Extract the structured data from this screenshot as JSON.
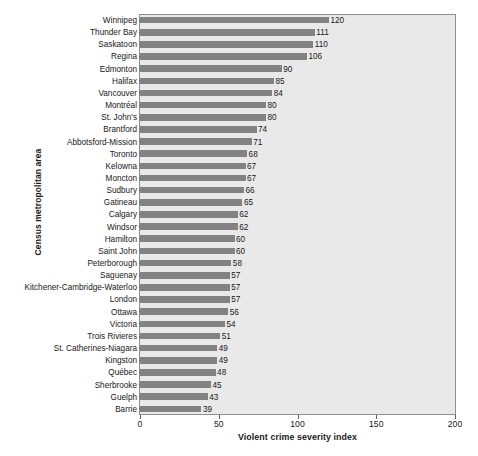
{
  "chart_data": {
    "type": "bar",
    "orientation": "horizontal",
    "title": "",
    "xlabel": "Violent crime severity index",
    "ylabel": "Census metropolitan area",
    "xlim": [
      0,
      200
    ],
    "xticks": [
      0,
      50,
      100,
      150,
      200
    ],
    "grid": false,
    "legend": null,
    "bar_color": "#828282",
    "plot_background": "#e9e9e9",
    "show_data_labels": true,
    "categories": [
      "Winnipeg",
      "Thunder Bay",
      "Saskatoon",
      "Regina",
      "Edmonton",
      "Halifax",
      "Vancouver",
      "Montréal",
      "St. John's",
      "Brantford",
      "Abbotsford-Mission",
      "Toronto",
      "Kelowna",
      "Moncton",
      "Sudbury",
      "Gatineau",
      "Calgary",
      "Windsor",
      "Hamilton",
      "Saint John",
      "Peterborough",
      "Saguenay",
      "Kitchener-Cambridge-Waterloo",
      "London",
      "Ottawa",
      "Victoria",
      "Trois Rivieres",
      "St. Catherines-Niagara",
      "Kingston",
      "Québec",
      "Sherbrooke",
      "Guelph",
      "Barrie"
    ],
    "values": [
      120,
      111,
      110,
      106,
      90,
      85,
      84,
      80,
      80,
      74,
      71,
      68,
      67,
      67,
      66,
      65,
      62,
      62,
      60,
      60,
      58,
      57,
      57,
      57,
      56,
      54,
      51,
      49,
      49,
      48,
      45,
      43,
      39
    ]
  }
}
